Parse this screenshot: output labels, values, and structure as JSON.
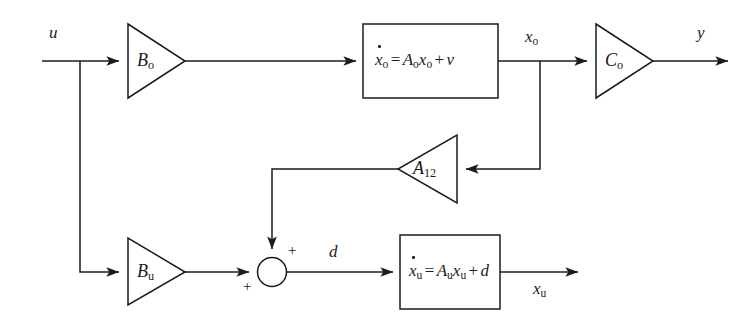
{
  "diagram": {
    "type": "control-system-block-diagram",
    "colors": {
      "background": "#ffffff",
      "line": "#1b1b1b",
      "text": "#1b1b1b"
    },
    "signals": {
      "input_u": "u",
      "output_y": "y",
      "state_xo": "x",
      "state_xo_sub": "o",
      "disturbance_d": "d",
      "state_xu": "x",
      "state_xu_sub": "u"
    },
    "gains": [
      {
        "name": "gain-bo",
        "label": "B",
        "sub": "o",
        "direction": "right"
      },
      {
        "name": "gain-co",
        "label": "C",
        "sub": "o",
        "direction": "right"
      },
      {
        "name": "gain-a12",
        "label": "A",
        "sub": "12",
        "direction": "left"
      },
      {
        "name": "gain-bu",
        "label": "B",
        "sub": "u",
        "direction": "right"
      }
    ],
    "blocks": [
      {
        "name": "observable-state-block",
        "equation": "ẋₒ = Aₒxₒ + ν",
        "lhs_var": "x",
        "lhs_sub": "o",
        "matrix": "A",
        "matrix_sub": "o",
        "state": "x",
        "state_sub": "o",
        "addend": "ν"
      },
      {
        "name": "unobservable-state-block",
        "equation": "ẋᵤ = Aᵤxᵤ + d",
        "lhs_var": "x",
        "lhs_sub": "u",
        "matrix": "A",
        "matrix_sub": "u",
        "state": "x",
        "state_sub": "u",
        "addend": "d"
      }
    ],
    "summing_junction": {
      "name": "summing-junction",
      "sign_top": "+",
      "sign_left": "+"
    }
  }
}
